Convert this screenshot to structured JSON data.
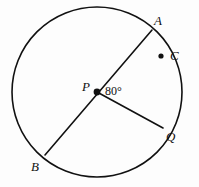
{
  "figure": {
    "kind": "circle-geometry-diagram",
    "background_color": "#fdfdfd",
    "stroke_color": "#111111",
    "canvas": {
      "width": 199,
      "height": 187
    }
  },
  "circle": {
    "center_label": "P",
    "center_x": 97,
    "center_y": 92,
    "radius": 85,
    "stroke_width": 1.6
  },
  "points": [
    {
      "id": "A",
      "label": "A",
      "x": 152,
      "y": 30,
      "label_x": 154,
      "label_y": 14,
      "on_circle": true,
      "dot": false
    },
    {
      "id": "C",
      "label": "C",
      "x": 161,
      "y": 56,
      "label_x": 170,
      "label_y": 49,
      "on_circle": true,
      "dot": true
    },
    {
      "id": "P",
      "label": "P",
      "x": 97,
      "y": 92,
      "label_x": 82,
      "label_y": 80,
      "on_circle": false,
      "dot": true
    },
    {
      "id": "Q",
      "label": "Q",
      "x": 163,
      "y": 128,
      "label_x": 166,
      "label_y": 130,
      "on_circle": true,
      "dot": false
    },
    {
      "id": "B",
      "label": "B",
      "x": 45,
      "y": 155,
      "label_x": 31,
      "label_y": 160,
      "on_circle": true,
      "dot": false
    }
  ],
  "segments": [
    {
      "id": "AB",
      "name": "diameter-a-b",
      "from": "A",
      "to": "B",
      "x1": 152,
      "y1": 30,
      "x2": 45,
      "y2": 155,
      "stroke_width": 1.6
    },
    {
      "id": "PQ",
      "name": "radius-p-q",
      "from": "P",
      "to": "Q",
      "x1": 97,
      "y1": 92,
      "x2": 163,
      "y2": 128,
      "stroke_width": 1.6
    }
  ],
  "angle": {
    "label": "80°",
    "value": 80,
    "unit": "degrees",
    "vertex": "P",
    "between": [
      "A",
      "Q"
    ],
    "label_x": 105,
    "label_y": 85
  }
}
